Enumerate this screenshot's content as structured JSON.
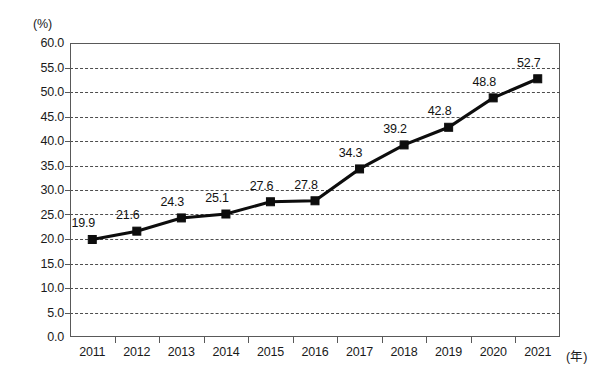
{
  "chart_data": {
    "type": "line",
    "title": "",
    "xlabel": "(年)",
    "ylabel": "(%)",
    "categories": [
      "2011",
      "2012",
      "2013",
      "2014",
      "2015",
      "2016",
      "2017",
      "2018",
      "2019",
      "2020",
      "2021"
    ],
    "values": [
      19.9,
      21.6,
      24.3,
      25.1,
      27.6,
      27.8,
      34.3,
      39.2,
      42.8,
      48.8,
      52.7
    ],
    "point_labels": [
      "19.9",
      "21.6",
      "24.3",
      "25.1",
      "27.6",
      "27.8",
      "34.3",
      "39.2",
      "42.8",
      "48.8",
      "52.7"
    ],
    "ylim": [
      0.0,
      60.0
    ],
    "ytick_step": 5.0,
    "ytick_labels": [
      "60.0",
      "55.0",
      "50.0",
      "45.0",
      "40.0",
      "35.0",
      "30.0",
      "25.0",
      "20.0",
      "15.0",
      "10.0",
      "5.0",
      "0.0"
    ],
    "ytick_values": [
      60.0,
      55.0,
      50.0,
      45.0,
      40.0,
      35.0,
      30.0,
      25.0,
      20.0,
      15.0,
      10.0,
      5.0,
      0.0
    ],
    "grid": true,
    "grid_style": "dashed-horizontal",
    "legend": false,
    "legend_position": "none",
    "series": [
      {
        "name": "",
        "values": [
          19.9,
          21.6,
          24.3,
          25.1,
          27.6,
          27.8,
          34.3,
          39.2,
          42.8,
          48.8,
          52.7
        ],
        "marker": "square",
        "color": "#0d0d0d"
      }
    ],
    "colors": {
      "line": "#0d0d0d",
      "marker": "#0d0d0d",
      "grid": "#4d4d4d",
      "axis": "#595959",
      "text": "#1a1a1a",
      "background": "#ffffff"
    }
  }
}
